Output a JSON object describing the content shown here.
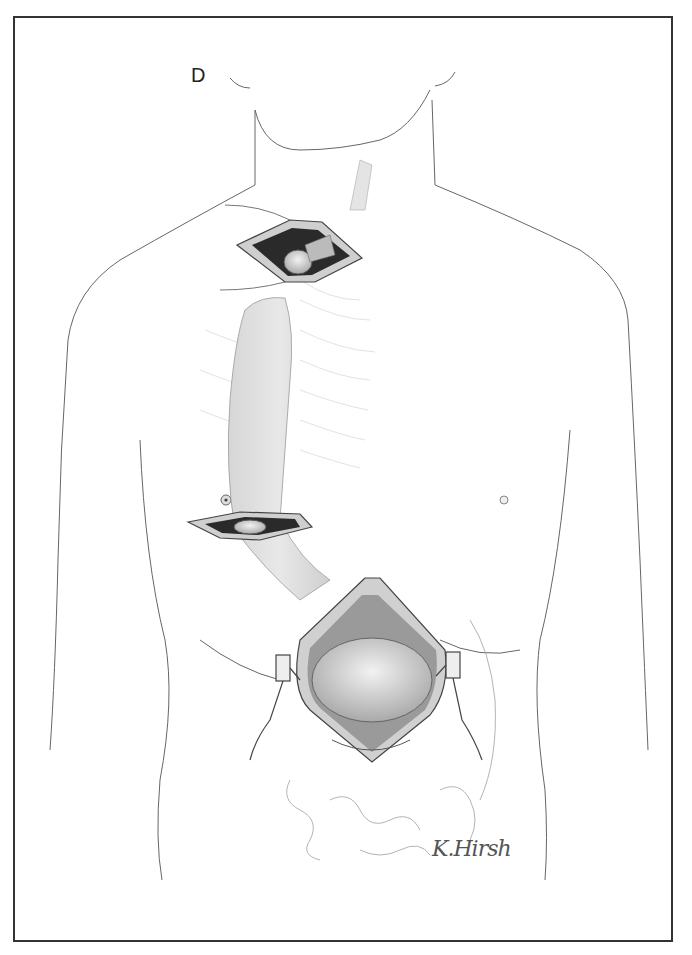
{
  "figure": {
    "panel_label": "D",
    "signature": "K.Hirsh",
    "colors": {
      "border": "#333333",
      "outline": "#555555",
      "shading": "#bdbdbd",
      "incision_dark": "#2a2a2a"
    }
  }
}
